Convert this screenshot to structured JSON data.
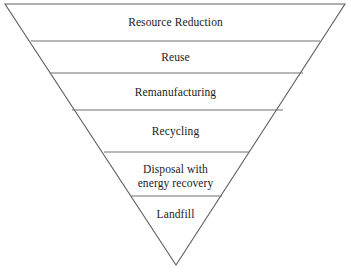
{
  "diagram": {
    "type": "inverted-pyramid",
    "orientation": "inverted",
    "background_color": "#ffffff",
    "outline_color": "#5f5f5f",
    "divider_color": "#6e6e6e",
    "text_color": "#1a1a1a",
    "tier_count": 6,
    "tiers": [
      {
        "rank": 1,
        "label": "Resource Reduction",
        "lines": [
          "Resource Reduction"
        ],
        "top_y": 4,
        "bottom_y": 41
      },
      {
        "rank": 2,
        "label": "Reuse",
        "lines": [
          "Reuse"
        ],
        "top_y": 41,
        "bottom_y": 73
      },
      {
        "rank": 3,
        "label": "Remanufacturing",
        "lines": [
          "Remanufacturing"
        ],
        "top_y": 73,
        "bottom_y": 110
      },
      {
        "rank": 4,
        "label": "Recycling",
        "lines": [
          "Recycling"
        ],
        "top_y": 110,
        "bottom_y": 152
      },
      {
        "rank": 5,
        "label": "Disposal with energy recovery",
        "lines": [
          "Disposal with",
          "energy recovery"
        ],
        "top_y": 152,
        "bottom_y": 196
      },
      {
        "rank": 6,
        "label": "Landfill",
        "lines": [
          "Landfill"
        ],
        "top_y": 196,
        "bottom_y": 265
      }
    ],
    "geometry": {
      "apex": {
        "x": 176,
        "y": 265
      },
      "top_left": {
        "x": 5,
        "y": 4
      },
      "top_right": {
        "x": 345,
        "y": 4
      },
      "dividers": [
        {
          "y": 41,
          "x1": 31,
          "x2": 320
        },
        {
          "y": 73,
          "x1": 50,
          "x2": 303
        },
        {
          "y": 110,
          "x1": 72,
          "x2": 283
        },
        {
          "y": 152,
          "x1": 104,
          "x2": 249
        },
        {
          "y": 196,
          "x1": 131,
          "x2": 222
        }
      ]
    },
    "labels_display": {
      "tier1": "Resource Reduction",
      "tier2": "Reuse",
      "tier3": "Remanufacturing",
      "tier4": "Recycling",
      "tier5": "Disposal with\nenergy recovery",
      "tier6": "Landfill"
    }
  }
}
